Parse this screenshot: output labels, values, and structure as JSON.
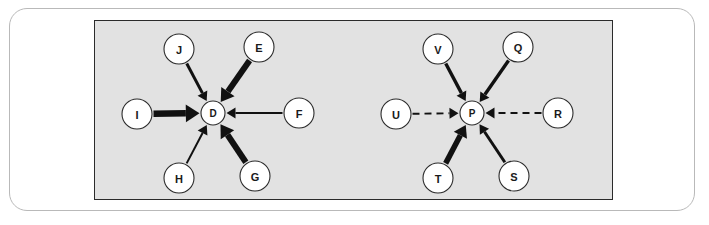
{
  "figure": {
    "panel_background": "#e2e2e2",
    "panel_border_color": "#2b2b2b",
    "outer_frame_color": "#b9b9b9",
    "page_background": "#ffffff",
    "edge_color": "#111111",
    "node_fill": "#ffffff",
    "node_stroke": "#2b2b2b"
  },
  "chart_data": {
    "type": "diagram",
    "title": "",
    "subtitle": "",
    "xlabel": "",
    "ylabel": "",
    "layout": "two side-by-side directed star (in-degree) graphs on a single shaded panel",
    "graphs": [
      {
        "id": "left-graph",
        "center": {
          "id": "D",
          "label": "D",
          "x": 118,
          "y": 92,
          "r": 12
        },
        "peripheral_nodes": [
          {
            "id": "J",
            "label": "J",
            "x": 84,
            "y": 28,
            "r": 15
          },
          {
            "id": "E",
            "label": "E",
            "x": 164,
            "y": 26,
            "r": 15
          },
          {
            "id": "I",
            "label": "I",
            "x": 42,
            "y": 93,
            "r": 15
          },
          {
            "id": "F",
            "label": "F",
            "x": 204,
            "y": 92,
            "r": 15
          },
          {
            "id": "H",
            "label": "H",
            "x": 84,
            "y": 157,
            "r": 15
          },
          {
            "id": "G",
            "label": "G",
            "x": 160,
            "y": 155,
            "r": 15
          }
        ],
        "edges": [
          {
            "from": "J",
            "to": "D",
            "weight": "medium",
            "style": "solid",
            "width": 3.0
          },
          {
            "from": "E",
            "to": "D",
            "weight": "heavy",
            "style": "solid",
            "width": 6.0
          },
          {
            "from": "I",
            "to": "D",
            "weight": "heavy",
            "style": "solid",
            "width": 6.5
          },
          {
            "from": "F",
            "to": "D",
            "weight": "light",
            "style": "solid",
            "width": 1.8
          },
          {
            "from": "H",
            "to": "D",
            "weight": "light",
            "style": "solid",
            "width": 2.0
          },
          {
            "from": "G",
            "to": "D",
            "weight": "heavy",
            "style": "solid",
            "width": 6.0
          }
        ]
      },
      {
        "id": "right-graph",
        "center": {
          "id": "P",
          "label": "P",
          "x": 377,
          "y": 92,
          "r": 12
        },
        "peripheral_nodes": [
          {
            "id": "V",
            "label": "V",
            "x": 343,
            "y": 28,
            "r": 15
          },
          {
            "id": "Q",
            "label": "Q",
            "x": 423,
            "y": 26,
            "r": 15
          },
          {
            "id": "U",
            "label": "U",
            "x": 301,
            "y": 93,
            "r": 15
          },
          {
            "id": "R",
            "label": "R",
            "x": 463,
            "y": 92,
            "r": 15
          },
          {
            "id": "T",
            "label": "T",
            "x": 343,
            "y": 157,
            "r": 15
          },
          {
            "id": "S",
            "label": "S",
            "x": 419,
            "y": 155,
            "r": 15
          }
        ],
        "edges": [
          {
            "from": "V",
            "to": "P",
            "weight": "medium",
            "style": "solid",
            "width": 3.4
          },
          {
            "from": "Q",
            "to": "P",
            "weight": "medium",
            "style": "solid",
            "width": 3.4
          },
          {
            "from": "U",
            "to": "P",
            "weight": "dashed",
            "style": "dashed",
            "width": 2.0
          },
          {
            "from": "R",
            "to": "P",
            "weight": "dashed",
            "style": "dashed",
            "width": 2.0
          },
          {
            "from": "T",
            "to": "P",
            "weight": "heavy",
            "style": "solid",
            "width": 5.5
          },
          {
            "from": "S",
            "to": "P",
            "weight": "medium",
            "style": "solid",
            "width": 3.0
          }
        ]
      }
    ]
  }
}
